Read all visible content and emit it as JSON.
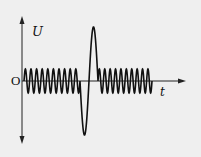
{
  "figure": {
    "y_axis_label": "U",
    "x_axis_label": "t",
    "origin_label": "O",
    "line_color": "#111111",
    "background_color": "#efefef"
  },
  "waveform": {
    "description": "Steady sinusoidal voltage with a single large transient pulse in the middle",
    "left_segment_cycles": 10,
    "right_segment_cycles": 10,
    "pulse": {
      "negative_peak_first": true,
      "relative_amplitude": 4.5
    }
  }
}
